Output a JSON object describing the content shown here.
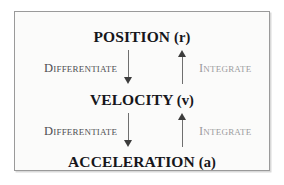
{
  "diagram": {
    "colors": {
      "background": "#ffffff",
      "panel_background": "#fbfbfa",
      "panel_border": "#9a9a9a",
      "node_text": "#16161a",
      "arrow_shaft": "#6f6f6f",
      "arrow_head": "#3c3c3c",
      "differentiate_label": "#4f4f52",
      "integrate_label": "#9b9b9e"
    },
    "nodes": [
      {
        "id": "position",
        "name": "POSITION",
        "symbol": "(r)"
      },
      {
        "id": "velocity",
        "name": "VELOCITY",
        "symbol": "(v)"
      },
      {
        "id": "acceleration",
        "name": "ACCELERATION",
        "symbol": "(a)"
      }
    ],
    "edges": [
      {
        "id": "differentiate-position-velocity",
        "label": "Differentiate",
        "from": "POSITION",
        "to": "VELOCITY",
        "direction": "down"
      },
      {
        "id": "integrate-velocity-position",
        "label": "Integrate",
        "from": "VELOCITY",
        "to": "POSITION",
        "direction": "up"
      },
      {
        "id": "differentiate-velocity-acceleration",
        "label": "Differentiate",
        "from": "VELOCITY",
        "to": "ACCELERATION",
        "direction": "down"
      },
      {
        "id": "integrate-acceleration-velocity",
        "label": "Integrate",
        "from": "ACCELERATION",
        "to": "VELOCITY",
        "direction": "up"
      }
    ]
  }
}
